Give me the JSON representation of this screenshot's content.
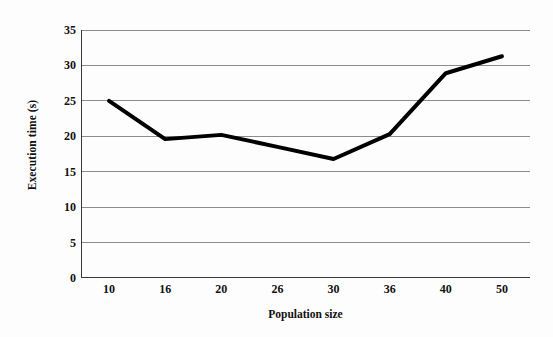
{
  "chart_data": {
    "type": "line",
    "title": "",
    "xlabel": "Population size",
    "ylabel": "Execution time (s)",
    "categories": [
      "10",
      "16",
      "20",
      "26",
      "30",
      "36",
      "40",
      "50"
    ],
    "values": [
      25.0,
      19.6,
      20.2,
      18.5,
      16.8,
      20.3,
      28.9,
      31.3
    ],
    "series": [
      {
        "name": "Execution time",
        "values": [
          25.0,
          19.6,
          20.2,
          18.5,
          16.8,
          20.3,
          28.9,
          31.3
        ],
        "color": "#000000"
      }
    ],
    "ylim": [
      0,
      35
    ],
    "y_ticks": [
      0,
      5,
      10,
      15,
      20,
      25,
      30,
      35
    ],
    "y_tick_labels": [
      "0",
      "5",
      "10",
      "15",
      "20",
      "25",
      "30",
      "35"
    ],
    "grid": true,
    "grid_axis": "y",
    "grid_color": "#8c8c8c",
    "legend": false,
    "legend_position": "none",
    "line_width": 4,
    "markers": false,
    "background_color": "#fdfdfd",
    "axis_color": "#3a3a3a",
    "tick_marks_between_categories": true
  },
  "axes": {
    "y_title": "Execution time (s)",
    "x_title": "Population size"
  }
}
